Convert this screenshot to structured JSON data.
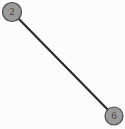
{
  "figure": {
    "name": "graph-figure",
    "width": 125,
    "height": 129,
    "background_color": "#fcfcfc"
  },
  "chart_data": {
    "type": "diagram",
    "title": "",
    "xlabel": "",
    "ylabel": "",
    "grid": false,
    "legend": null,
    "diagram_kind": "undirected-graph",
    "nodes": [
      {
        "id": "2",
        "label": "2",
        "cx": 12,
        "cy": 12,
        "r": 9.5,
        "fill_color": "#9a9a9a",
        "stroke_color": "#4a4a4a",
        "label_color": "#3a3a3a"
      },
      {
        "id": "6",
        "label": "6",
        "cx": 114,
        "cy": 116,
        "r": 9.0,
        "fill_color": "#9a9a9a",
        "stroke_color": "#4a4a4a",
        "label_color": "#3a3a3a"
      }
    ],
    "edges": [
      {
        "source": "2",
        "target": "6",
        "label": "",
        "color": "#2b2b2b",
        "width": 2.2
      }
    ]
  }
}
